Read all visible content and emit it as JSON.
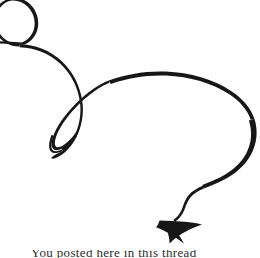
{
  "figure": {
    "kind": "calligraphic-swirl-arrow",
    "title": "Decorative swirl arrow ornament",
    "width": 260,
    "height": 258,
    "background_color": "#ffffff",
    "ink_color": "#171717",
    "stroke": {
      "style": "variable-width calligraphic",
      "min_width_px": 0.9,
      "max_width_px": 4.5,
      "color": "#171717"
    },
    "arrowhead": {
      "name": "barbed-dart",
      "direction": "down-left",
      "tip_x": 160,
      "tip_y": 220,
      "length_px": 46,
      "color": "#171717"
    },
    "loops": [
      {
        "name": "upper-left-loop",
        "center_x": 18,
        "center_y": 28,
        "radius_px": 26,
        "orientation": "round"
      },
      {
        "name": "center-slanted-loop",
        "center_x": 78,
        "center_y": 128,
        "length_px": 62,
        "orientation": "slanted-narrow"
      }
    ]
  },
  "caption": {
    "text": "You posted here in this thread",
    "visible_portion": "ascender tips only (clipped by frame edge)",
    "color": "#2b2b2b"
  }
}
